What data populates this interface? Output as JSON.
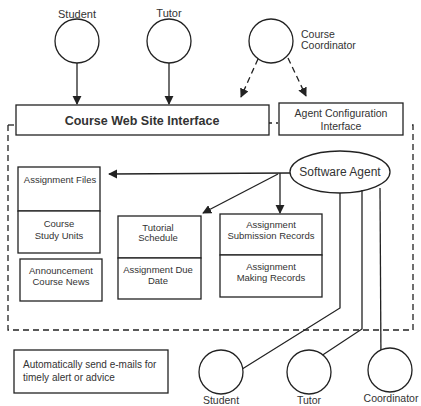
{
  "actors_top": {
    "student": "Student",
    "tutor": "Tutor",
    "coordinator_line1": "Course",
    "coordinator_line2": "Coordinator"
  },
  "interfaces": {
    "course_web_site": "Course Web Site Interface",
    "agent_config_line1": "Agent Configuration",
    "agent_config_line2": "Interface"
  },
  "agent": {
    "label": "Software Agent"
  },
  "data_stores": {
    "assignment_files": "Assignment Files",
    "course_study_units_line1": "Course",
    "course_study_units_line2": "Study Units",
    "announcement_line1": "Announcement",
    "announcement_line2": "Course News",
    "tutorial_schedule_line1": "Tutorial",
    "tutorial_schedule_line2": "Schedule",
    "assignment_due_line1": "Assignment Due",
    "assignment_due_line2": "Date",
    "submission_records_line1": "Assignment",
    "submission_records_line2": "Submission Records",
    "making_records_line1": "Assignment",
    "making_records_line2": "Making Records"
  },
  "note": {
    "line1": "Automatically send e-mails for",
    "line2": "timely alert or advice"
  },
  "actors_bottom": {
    "student": "Student",
    "tutor": "Tutor",
    "coordinator": "Coordinator"
  }
}
